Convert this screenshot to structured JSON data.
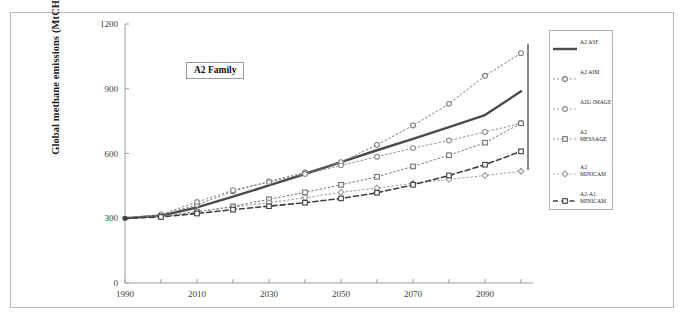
{
  "figure": {
    "annotation_label": "A2 Family",
    "frame_color": "#b9b9b9",
    "background": "#ffffff"
  },
  "chart_data": {
    "type": "line",
    "title": "",
    "xlabel": "",
    "ylabel": "Global methane emissions (MtCH4/yr)",
    "ylabel_parts": {
      "pre": "Global methane emissions (MtCH",
      "sub": "4",
      "post": "/yr)"
    },
    "xlim": [
      1990,
      2100
    ],
    "ylim": [
      0,
      1200
    ],
    "yticks": [
      0,
      300,
      600,
      900,
      1200
    ],
    "xticks": [
      1990,
      2010,
      2030,
      2050,
      2070,
      2090
    ],
    "xtick_labels": [
      "1990",
      "2010",
      "2030",
      "2050",
      "2070",
      "2090"
    ],
    "ytick_labels": [
      "0",
      "300",
      "600",
      "900",
      "1200"
    ],
    "xminor_step": 10,
    "grid": false,
    "legend_position": "right-outside",
    "annotations": [
      "A2 Family"
    ],
    "x": [
      1990,
      2000,
      2010,
      2020,
      2030,
      2040,
      2050,
      2060,
      2070,
      2080,
      2090,
      2100
    ],
    "series": [
      {
        "name": "A2 ASF",
        "style": "solid",
        "color": "#4b4b4b",
        "marker": "none",
        "width": 2.4,
        "values": [
          300,
          312,
          350,
          400,
          452,
          505,
          560,
          615,
          668,
          722,
          778,
          888
        ]
      },
      {
        "name": "A2 AIM",
        "style": "dotted",
        "color": "#7a7a7a",
        "marker": "circle",
        "width": 1,
        "values": [
          300,
          315,
          362,
          425,
          470,
          512,
          560,
          640,
          730,
          830,
          960,
          1065
        ]
      },
      {
        "name": "A2G IMAGE",
        "style": "dotted",
        "color": "#8a8a8a",
        "marker": "circle",
        "width": 1,
        "values": [
          300,
          318,
          375,
          430,
          468,
          505,
          545,
          585,
          625,
          660,
          700,
          740
        ]
      },
      {
        "name": "A2 MESSAGE",
        "style": "dotted",
        "color": "#6f6f6f",
        "marker": "square",
        "width": 1,
        "values": [
          300,
          310,
          330,
          355,
          388,
          420,
          455,
          492,
          540,
          592,
          650,
          740
        ]
      },
      {
        "name": "A2 MINICAM",
        "style": "dotted",
        "color": "#9b9b9b",
        "marker": "diamond",
        "width": 1,
        "values": [
          300,
          308,
          330,
          352,
          372,
          395,
          420,
          440,
          462,
          480,
          498,
          518
        ]
      },
      {
        "name": "A2-A1 MINICAM",
        "style": "dashed",
        "color": "#3f3f3f",
        "marker": "square",
        "width": 1.6,
        "values": [
          300,
          306,
          322,
          340,
          356,
          372,
          392,
          418,
          455,
          498,
          548,
          610
        ]
      }
    ],
    "legend": [
      {
        "label": "A2 ASF",
        "lines": [
          "A2 ASF"
        ]
      },
      {
        "label": "A2 AIM",
        "lines": [
          "A2 AIM"
        ]
      },
      {
        "label": "A2G IMAGE",
        "lines": [
          "A2G IMAGE"
        ]
      },
      {
        "label": "A2 MESSAGE",
        "lines": [
          "A2",
          "MESSAGE"
        ]
      },
      {
        "label": "A2 MINICAM",
        "lines": [
          "A2 MINICAM"
        ]
      },
      {
        "label": "A2-A1 MINICAM",
        "lines": [
          "A2-A1",
          "MINICAM"
        ]
      }
    ]
  }
}
